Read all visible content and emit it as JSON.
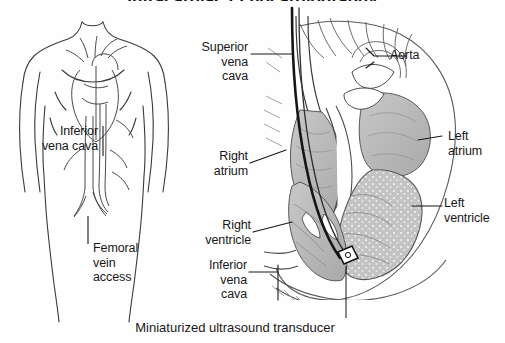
{
  "figure": {
    "title_partial": "Intracardiac Echocardiography",
    "caption": "Miniaturized ultrasound transducer",
    "background_color": "#fefefe",
    "ink_color": "#18181a",
    "tissue_fill": "#b9b9b9",
    "catheter_color": "#1a1a1a"
  },
  "body_panel": {
    "name": "whole-body-venous-access-diagram",
    "labels": [
      {
        "id": "inferior-vena-cava",
        "text": "Inferior\nvena cava",
        "align": "right"
      },
      {
        "id": "femoral-vein-access",
        "text": "Femoral\nvein\naccess",
        "align": "left"
      }
    ]
  },
  "heart_panel": {
    "name": "heart-cross-section-diagram",
    "labels_left": [
      {
        "id": "superior-vena-cava",
        "text": "Superior\nvena\ncava"
      },
      {
        "id": "right-atrium",
        "text": "Right\natrium"
      },
      {
        "id": "right-ventricle",
        "text": "Right\nventricle"
      },
      {
        "id": "inferior-vena-cava",
        "text": "Inferior\nvena\ncava"
      }
    ],
    "labels_right": [
      {
        "id": "aorta",
        "text": "Aorta"
      },
      {
        "id": "left-atrium",
        "text": "Left\natrium"
      },
      {
        "id": "left-ventricle",
        "text": "Left\nventricle"
      }
    ]
  }
}
